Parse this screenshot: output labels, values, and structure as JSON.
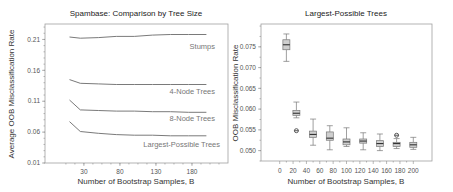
{
  "chart_data": [
    {
      "type": "line",
      "title": "Spambase: Comparison by Tree Size",
      "xlabel": "Number of Bootstrap Samples, B",
      "ylabel": "Average OOB Misclassification Rate",
      "xlim": [
        -24,
        230
      ],
      "ylim": [
        0.01,
        0.235
      ],
      "xticks": [
        30,
        80,
        130,
        180
      ],
      "yticks": [
        0.21,
        0.16,
        0.11,
        0.06,
        0.01
      ],
      "ytick_labels": [
        "0.21",
        "0.16",
        "0.11",
        "0.06",
        "0.01"
      ],
      "grid": false,
      "x": [
        10,
        25,
        50,
        75,
        100,
        125,
        150,
        175,
        200
      ],
      "series": [
        {
          "name": "Stumps",
          "values": [
            0.214,
            0.212,
            0.213,
            0.215,
            0.215,
            0.217,
            0.218,
            0.218,
            0.218
          ]
        },
        {
          "name": "4-Node Trees",
          "values": [
            0.145,
            0.139,
            0.138,
            0.137,
            0.137,
            0.137,
            0.137,
            0.137,
            0.137
          ]
        },
        {
          "name": "8-Node Trees",
          "values": [
            0.112,
            0.096,
            0.095,
            0.094,
            0.094,
            0.093,
            0.093,
            0.092,
            0.092
          ]
        },
        {
          "name": "Largest-Possible Trees",
          "values": [
            0.077,
            0.061,
            0.058,
            0.056,
            0.055,
            0.055,
            0.054,
            0.054,
            0.054
          ]
        }
      ]
    },
    {
      "type": "box",
      "title": "Largest-Possible Trees",
      "xlabel": "Number of Bootstrap Samples, B",
      "ylabel": "OOB Misclassification Rate",
      "xlim": [
        -28,
        228
      ],
      "ylim": [
        0.0475,
        0.0805
      ],
      "xticks": [
        0,
        20,
        40,
        60,
        80,
        100,
        120,
        140,
        160,
        180,
        200
      ],
      "yticks": [
        0.075,
        0.07,
        0.065,
        0.06,
        0.055,
        0.05
      ],
      "ytick_labels": [
        "0.075",
        "0.070",
        "0.065",
        "0.060",
        "0.055",
        "0.050"
      ],
      "grid": false,
      "boxes": [
        {
          "x": 10,
          "min": 0.0715,
          "q1": 0.0743,
          "median": 0.0755,
          "q3": 0.0767,
          "max": 0.0781,
          "outliers": []
        },
        {
          "x": 25,
          "min": 0.0579,
          "q1": 0.0585,
          "median": 0.059,
          "q3": 0.0597,
          "max": 0.0617,
          "outliers": [
            0.0548
          ]
        },
        {
          "x": 50,
          "min": 0.0513,
          "q1": 0.0532,
          "median": 0.0539,
          "q3": 0.0547,
          "max": 0.0576,
          "outliers": []
        },
        {
          "x": 75,
          "min": 0.0502,
          "q1": 0.0525,
          "median": 0.053,
          "q3": 0.0545,
          "max": 0.056,
          "outliers": []
        },
        {
          "x": 100,
          "min": 0.051,
          "q1": 0.0514,
          "median": 0.0521,
          "q3": 0.0528,
          "max": 0.0555,
          "outliers": []
        },
        {
          "x": 125,
          "min": 0.0502,
          "q1": 0.0518,
          "median": 0.0523,
          "q3": 0.0528,
          "max": 0.0543,
          "outliers": []
        },
        {
          "x": 150,
          "min": 0.05,
          "q1": 0.051,
          "median": 0.0517,
          "q3": 0.0524,
          "max": 0.054,
          "outliers": []
        },
        {
          "x": 175,
          "min": 0.0505,
          "q1": 0.051,
          "median": 0.0517,
          "q3": 0.052,
          "max": 0.0529,
          "outliers": [
            0.0537
          ]
        },
        {
          "x": 200,
          "min": 0.0503,
          "q1": 0.0508,
          "median": 0.0514,
          "q3": 0.052,
          "max": 0.0532,
          "outliers": []
        }
      ]
    }
  ]
}
